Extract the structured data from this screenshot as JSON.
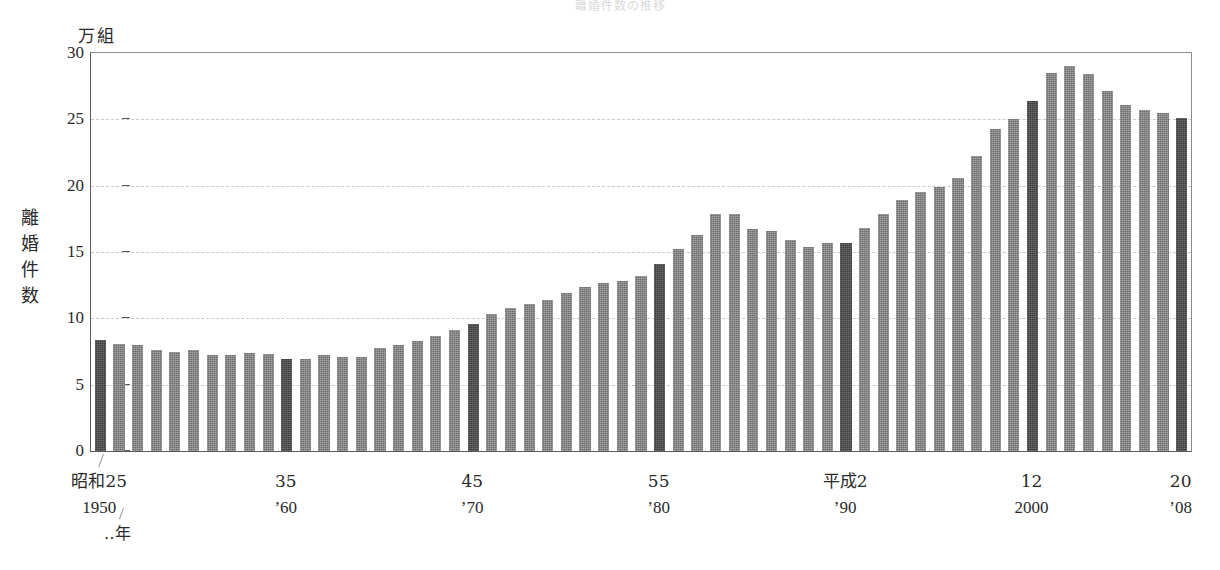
{
  "title_strip": "離婚件数の推移",
  "unit_label": "万組",
  "yaxis_title": [
    "離",
    "婚",
    "件",
    "数"
  ],
  "xaxis_unit": "‥年",
  "chart_data": {
    "type": "bar",
    "title": "離婚件数の推移",
    "xlabel": "‥年",
    "ylabel": "離婚件数",
    "unit": "万組",
    "ylim": [
      0,
      30
    ],
    "ytick_labels": [
      "0",
      "5",
      "10",
      "15",
      "20",
      "25",
      "30"
    ],
    "ytick_values": [
      0,
      5,
      10,
      15,
      20,
      25,
      30
    ],
    "grid": true,
    "grid_style": "dashed-horizontal",
    "legend": "none",
    "bar_color": "#6d6d6d",
    "highlight_bar_color": "#3d3d3d",
    "highlight_years": [
      1950,
      1960,
      1970,
      1980,
      1990,
      2000,
      2008
    ],
    "xtick_labels": [
      {
        "era": "昭和25",
        "west": "1950",
        "year": 1950
      },
      {
        "era": "35",
        "west": "’60",
        "year": 1960
      },
      {
        "era": "45",
        "west": "’70",
        "year": 1970
      },
      {
        "era": "55",
        "west": "’80",
        "year": 1980
      },
      {
        "era": "平成2",
        "west": "’90",
        "year": 1990
      },
      {
        "era": "12",
        "west": "2000",
        "year": 2000
      },
      {
        "era": "20",
        "west": "’08",
        "year": 2008
      }
    ],
    "categories": [
      1950,
      1951,
      1952,
      1953,
      1954,
      1955,
      1956,
      1957,
      1958,
      1959,
      1960,
      1961,
      1962,
      1963,
      1964,
      1965,
      1966,
      1967,
      1968,
      1969,
      1970,
      1971,
      1972,
      1973,
      1974,
      1975,
      1976,
      1977,
      1978,
      1979,
      1980,
      1981,
      1982,
      1983,
      1984,
      1985,
      1986,
      1987,
      1988,
      1989,
      1990,
      1991,
      1992,
      1993,
      1994,
      1995,
      1996,
      1997,
      1998,
      1999,
      2000,
      2001,
      2002,
      2003,
      2004,
      2005,
      2006,
      2007,
      2008
    ],
    "values": [
      8.4,
      8.1,
      8.0,
      7.6,
      7.5,
      7.6,
      7.2,
      7.2,
      7.4,
      7.3,
      6.9,
      6.9,
      7.2,
      7.1,
      7.1,
      7.8,
      8.0,
      8.3,
      8.7,
      9.1,
      9.6,
      10.3,
      10.8,
      11.1,
      11.4,
      11.9,
      12.4,
      12.7,
      12.8,
      13.2,
      14.1,
      15.2,
      16.3,
      17.9,
      17.9,
      16.7,
      16.6,
      15.9,
      15.4,
      15.7,
      15.7,
      16.8,
      17.9,
      18.9,
      19.5,
      19.9,
      20.6,
      22.2,
      24.3,
      25.0,
      26.4,
      28.5,
      29.0,
      28.4,
      27.1,
      26.1,
      25.7,
      25.5,
      25.1
    ]
  }
}
